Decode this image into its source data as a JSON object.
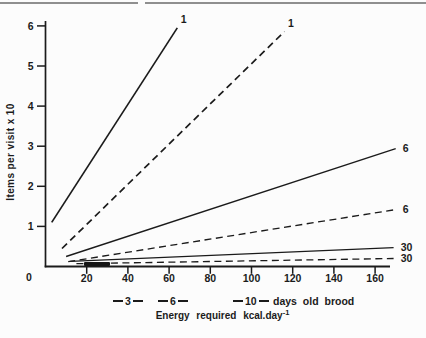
{
  "figure": {
    "background": "#fcfcfc",
    "ink_color": "#1b1b1b",
    "rule_color": "#8f8f8f"
  },
  "chart_data": {
    "type": "line",
    "title": "",
    "xlabel": "Energy required kcal.day⁻¹",
    "xlabel_base": "Energy required kcal.day",
    "xlabel_sup": "-1",
    "ylabel": "Items per visit x 10",
    "xlim": [
      0,
      170
    ],
    "ylim": [
      0,
      6
    ],
    "grid": false,
    "x_origin_label": "0",
    "x_ticks": [
      20,
      40,
      60,
      80,
      100,
      120,
      140,
      160
    ],
    "y_ticks": [
      1,
      2,
      3,
      4,
      5,
      6
    ],
    "legend_position": "bottom",
    "legend_items": [
      "3",
      "6",
      "10"
    ],
    "legend_suffix": "days old brood",
    "series": [
      {
        "name": "brood-1-solid",
        "end_label": "1",
        "style": "solid",
        "label_pos": "top",
        "points": [
          [
            3,
            1.1
          ],
          [
            64,
            5.95
          ]
        ]
      },
      {
        "name": "brood-1-dashed",
        "end_label": "1",
        "style": "dashed",
        "label_pos": "top",
        "points": [
          [
            8,
            0.45
          ],
          [
            116,
            5.86
          ]
        ]
      },
      {
        "name": "brood-6-solid",
        "end_label": "6",
        "style": "solid",
        "label_pos": "right",
        "points": [
          [
            10,
            0.25
          ],
          [
            170,
            2.94
          ]
        ]
      },
      {
        "name": "brood-6-dashed",
        "end_label": "6",
        "style": "dashed",
        "label_pos": "right",
        "points": [
          [
            11,
            0.12
          ],
          [
            170,
            1.42
          ]
        ]
      },
      {
        "name": "brood-30-solid",
        "end_label": "30",
        "style": "solid",
        "label_pos": "right",
        "points": [
          [
            12,
            0.13
          ],
          [
            169,
            0.47
          ]
        ]
      },
      {
        "name": "brood-30-dashed",
        "end_label": "30",
        "style": "dashed",
        "label_pos": "right",
        "points": [
          [
            15,
            0.07
          ],
          [
            169,
            0.2
          ]
        ]
      }
    ]
  }
}
